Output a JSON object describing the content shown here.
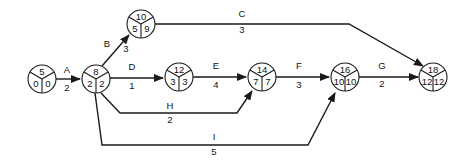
{
  "diagram": {
    "type": "activity-on-arrow network (critical path)",
    "nodes": [
      {
        "id": "5",
        "top": "5",
        "left": "0",
        "right": "0",
        "x": 42,
        "y": 79
      },
      {
        "id": "8",
        "top": "8",
        "left": "2",
        "right": "2",
        "x": 96,
        "y": 79
      },
      {
        "id": "10",
        "top": "10",
        "left": "5",
        "right": "9",
        "x": 141,
        "y": 24
      },
      {
        "id": "12",
        "top": "12",
        "left": "3",
        "right": "3",
        "x": 179,
        "y": 77
      },
      {
        "id": "14",
        "top": "14",
        "left": "7",
        "right": "7",
        "x": 262,
        "y": 77
      },
      {
        "id": "16",
        "top": "16",
        "left": "10",
        "right": "10",
        "x": 345,
        "y": 77
      },
      {
        "id": "18",
        "top": "18",
        "left": "12",
        "right": "12",
        "x": 433,
        "y": 77
      }
    ],
    "edges": [
      {
        "activity": "A",
        "duration": "2",
        "from": "5",
        "to": "8",
        "points": "56,79 80,79",
        "label_pos": [
          67,
          70
        ],
        "dur_pos": [
          67,
          88
        ]
      },
      {
        "activity": "B",
        "duration": "3",
        "from": "8",
        "to": "10",
        "points": "102,66 129,35",
        "label_pos": [
          107,
          44
        ],
        "dur_pos": [
          126,
          49
        ]
      },
      {
        "activity": "C",
        "duration": "3",
        "from": "10",
        "to": "18",
        "points": "155,24 349,24 423,66",
        "label_pos": [
          242,
          14
        ],
        "dur_pos": [
          242,
          30
        ]
      },
      {
        "activity": "D",
        "duration": "1",
        "from": "8",
        "to": "12",
        "points": "110,78 163,78",
        "label_pos": [
          132,
          67
        ],
        "dur_pos": [
          132,
          86
        ]
      },
      {
        "activity": "E",
        "duration": "4",
        "from": "12",
        "to": "14",
        "points": "193,77 246,77",
        "label_pos": [
          216,
          66
        ],
        "dur_pos": [
          216,
          85
        ]
      },
      {
        "activity": "F",
        "duration": "3",
        "from": "14",
        "to": "16",
        "points": "276,77 329,77",
        "label_pos": [
          299,
          66
        ],
        "dur_pos": [
          299,
          85
        ]
      },
      {
        "activity": "G",
        "duration": "2",
        "from": "16",
        "to": "18",
        "points": "359,77 418,77",
        "label_pos": [
          382,
          66
        ],
        "dur_pos": [
          382,
          84
        ]
      },
      {
        "activity": "H",
        "duration": "2",
        "from": "8",
        "to": "14",
        "points": "101,93 120,113 237,113 252,91",
        "label_pos": [
          170,
          106
        ],
        "dur_pos": [
          170,
          120
        ]
      },
      {
        "activity": "I",
        "duration": "5",
        "from": "8",
        "to": "16",
        "points": "95,93 102,145 308,145 335,93",
        "label_pos": [
          214,
          137
        ],
        "dur_pos": [
          214,
          152
        ]
      }
    ],
    "colors": {
      "line": "#1a1a1a",
      "background": "#ffffff"
    }
  }
}
